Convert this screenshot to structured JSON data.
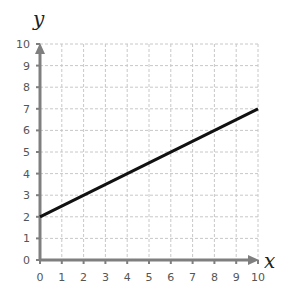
{
  "chart_data": {
    "type": "line",
    "title": "",
    "xlabel": "x",
    "ylabel": "y",
    "xlim": [
      0,
      10
    ],
    "ylim": [
      0,
      10
    ],
    "x_ticks": [
      0,
      1,
      2,
      3,
      4,
      5,
      6,
      7,
      8,
      9,
      10
    ],
    "y_ticks": [
      0,
      1,
      2,
      3,
      4,
      5,
      6,
      7,
      8,
      9,
      10
    ],
    "grid": true,
    "grid_style": "dashed",
    "legend": null,
    "series": [
      {
        "name": "line",
        "x": [
          0,
          10
        ],
        "y": [
          2,
          7
        ],
        "color": "#111111"
      }
    ]
  },
  "colors": {
    "axis": "#7f7f7f",
    "grid": "#c8c8c8",
    "line": "#111111",
    "tick_label": "#555555",
    "axis_label": "#222222"
  }
}
